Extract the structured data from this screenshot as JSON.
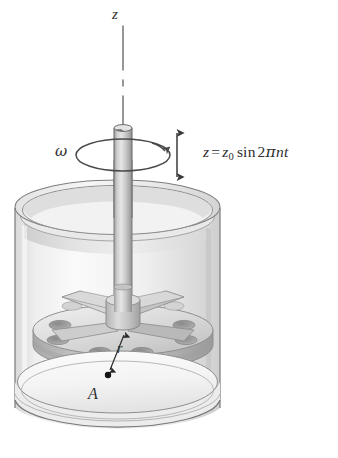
{
  "figure": {
    "labels": {
      "z_axis": "z",
      "angular_velocity": "ω",
      "equation_lhs": "z",
      "equation_equals": "=",
      "equation_amplitude": "z",
      "equation_amplitude_subscript": "0",
      "equation_function": "sin",
      "equation_coefficient": "2",
      "equation_pi": "π",
      "equation_frequency": "n",
      "equation_time": "t",
      "equation_full": "z = z0 sin 2πnt",
      "radius": "r",
      "point": "A"
    },
    "icons": {
      "oscillation_arrow": "double-headed-vertical-arrow-icon",
      "rotation_arrow": "circular-rotation-arrow-icon",
      "radius_arrow": "radius-leader-arrow-icon",
      "axis_line": "dash-dot-centerline-icon"
    },
    "colors": {
      "background": "#ffffff",
      "ink": "#2e2e2e",
      "outline": "#6e6e6e",
      "glass_light": "#f3f3f3",
      "glass_mid": "#e3e3e3",
      "glass_shadow": "#cfcfcf",
      "metal_light": "#e8e8e8",
      "metal_mid": "#c6c6c6",
      "metal_dark": "#9e9e9e",
      "hole_dark": "#8d8d8d",
      "point_marker": "#1a1a1a"
    },
    "geometry": {
      "vessel_left_px": 15,
      "vessel_right_px": 220,
      "vessel_top_px": 200,
      "vessel_bottom_px": 430,
      "shaft_center_x_px": 123,
      "shaft_top_px": 122,
      "disk_center_y_px": 330,
      "disk_hole_count": 8,
      "impeller_arm_count": 4
    }
  }
}
